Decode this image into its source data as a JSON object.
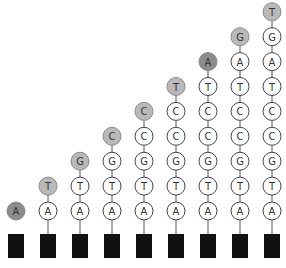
{
  "diagram": {
    "sequence": [
      "A",
      "T",
      "G",
      "C",
      "C",
      "T",
      "A",
      "G",
      "T"
    ],
    "columns": [
      {
        "index": 1,
        "nucleotides_bottom_to_top": [
          "A"
        ],
        "newest": "A"
      },
      {
        "index": 2,
        "nucleotides_bottom_to_top": [
          "A",
          "T"
        ],
        "newest": "T"
      },
      {
        "index": 3,
        "nucleotides_bottom_to_top": [
          "A",
          "T",
          "G"
        ],
        "newest": "G"
      },
      {
        "index": 4,
        "nucleotides_bottom_to_top": [
          "A",
          "T",
          "G",
          "C"
        ],
        "newest": "C"
      },
      {
        "index": 5,
        "nucleotides_bottom_to_top": [
          "A",
          "T",
          "G",
          "C",
          "C"
        ],
        "newest": "C"
      },
      {
        "index": 6,
        "nucleotides_bottom_to_top": [
          "A",
          "T",
          "G",
          "C",
          "C",
          "T"
        ],
        "newest": "T"
      },
      {
        "index": 7,
        "nucleotides_bottom_to_top": [
          "A",
          "T",
          "G",
          "C",
          "C",
          "T",
          "A"
        ],
        "newest": "A"
      },
      {
        "index": 8,
        "nucleotides_bottom_to_top": [
          "A",
          "T",
          "G",
          "C",
          "C",
          "T",
          "A",
          "G"
        ],
        "newest": "G"
      },
      {
        "index": 9,
        "nucleotides_bottom_to_top": [
          "A",
          "T",
          "G",
          "C",
          "C",
          "T",
          "A",
          "G",
          "T"
        ],
        "newest": "T"
      }
    ],
    "first_column_connected": false,
    "colors": {
      "anchor": "#111111",
      "line": "#555555",
      "circle_fill": "#ffffff",
      "circle_stroke": "#444444",
      "newest_fill_A": "#8c8c8c",
      "newest_fill_other": "#b9b9b9",
      "text": "#333333"
    }
  }
}
